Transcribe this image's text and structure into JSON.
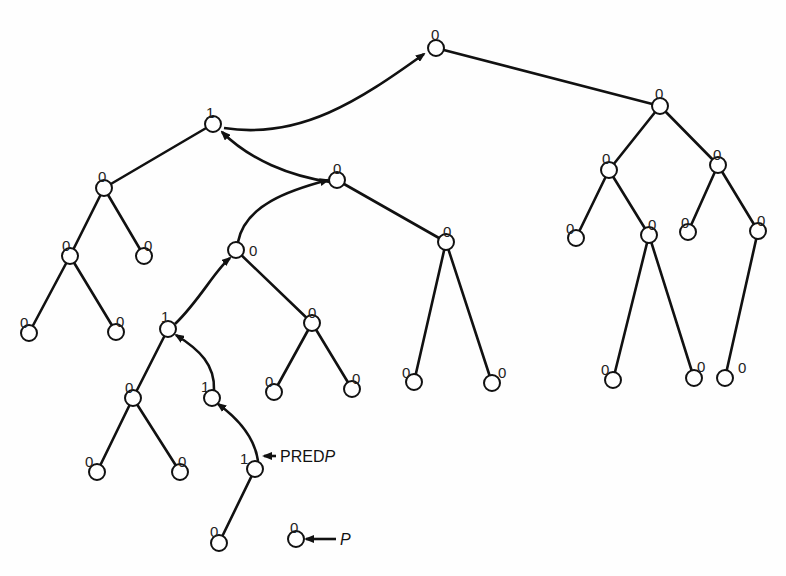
{
  "diagram": {
    "type": "threaded binary tree",
    "nodes": [
      {
        "id": "root",
        "x": 436,
        "y": 48,
        "tag": "0",
        "lx": 431,
        "ly": 28
      },
      {
        "id": "R",
        "x": 660,
        "y": 106,
        "tag": "0",
        "lx": 655,
        "ly": 87
      },
      {
        "id": "RL",
        "x": 609,
        "y": 170,
        "tag": "0",
        "lx": 602,
        "ly": 152
      },
      {
        "id": "RR",
        "x": 718,
        "y": 165,
        "tag": "0",
        "lx": 713,
        "ly": 148
      },
      {
        "id": "RLL",
        "x": 576,
        "y": 238,
        "tag": "0",
        "lx": 566,
        "ly": 222
      },
      {
        "id": "RLR",
        "x": 649,
        "y": 235,
        "tag": "0",
        "lx": 648,
        "ly": 218
      },
      {
        "id": "RLRL",
        "x": 613,
        "y": 380,
        "tag": "0",
        "lx": 601,
        "ly": 363
      },
      {
        "id": "RLRR",
        "x": 694,
        "y": 378,
        "tag": "0",
        "lx": 697,
        "ly": 360
      },
      {
        "id": "RRL",
        "x": 688,
        "y": 232,
        "tag": "0",
        "lx": 681,
        "ly": 216
      },
      {
        "id": "RRR",
        "x": 758,
        "y": 231,
        "tag": "0",
        "lx": 757,
        "ly": 214
      },
      {
        "id": "RRRL",
        "x": 725,
        "y": 378,
        "tag": "0",
        "lx": 738,
        "ly": 361
      },
      {
        "id": "A",
        "x": 213,
        "y": 124,
        "tag": "1",
        "lx": 206,
        "ly": 106
      },
      {
        "id": "AL",
        "x": 104,
        "y": 188,
        "tag": "0",
        "lx": 98,
        "ly": 170
      },
      {
        "id": "AR",
        "x": 337,
        "y": 180,
        "tag": "0",
        "lx": 333,
        "ly": 162
      },
      {
        "id": "ALL",
        "x": 70,
        "y": 256,
        "tag": "0",
        "lx": 62,
        "ly": 239
      },
      {
        "id": "ALR",
        "x": 144,
        "y": 256,
        "tag": "0",
        "lx": 144,
        "ly": 239
      },
      {
        "id": "ALLL",
        "x": 29,
        "y": 333,
        "tag": "0",
        "lx": 20,
        "ly": 316
      },
      {
        "id": "ALLR",
        "x": 116,
        "y": 332,
        "tag": "0",
        "lx": 116,
        "ly": 315
      },
      {
        "id": "ARL",
        "x": 236,
        "y": 250,
        "tag": "0",
        "lx": 249,
        "ly": 244
      },
      {
        "id": "ARR",
        "x": 446,
        "y": 242,
        "tag": "0",
        "lx": 443,
        "ly": 225
      },
      {
        "id": "ARRL",
        "x": 414,
        "y": 382,
        "tag": "0",
        "lx": 402,
        "ly": 366
      },
      {
        "id": "ARRR",
        "x": 492,
        "y": 383,
        "tag": "0",
        "lx": 498,
        "ly": 366
      },
      {
        "id": "ARLL",
        "x": 168,
        "y": 329,
        "tag": "1",
        "lx": 161,
        "ly": 310
      },
      {
        "id": "ARLR",
        "x": 312,
        "y": 323,
        "tag": "0",
        "lx": 308,
        "ly": 306
      },
      {
        "id": "ARLRL",
        "x": 274,
        "y": 392,
        "tag": "0",
        "lx": 265,
        "ly": 375
      },
      {
        "id": "ARLRR",
        "x": 352,
        "y": 389,
        "tag": "0",
        "lx": 352,
        "ly": 372
      },
      {
        "id": "ARLLL",
        "x": 133,
        "y": 398,
        "tag": "0",
        "lx": 125,
        "ly": 381
      },
      {
        "id": "ARLLR",
        "x": 212,
        "y": 398,
        "tag": "1",
        "lx": 201,
        "ly": 380
      },
      {
        "id": "ARLLLL",
        "x": 97,
        "y": 472,
        "tag": "0",
        "lx": 85,
        "ly": 455
      },
      {
        "id": "ARLLLR",
        "x": 180,
        "y": 472,
        "tag": "0",
        "lx": 178,
        "ly": 455
      },
      {
        "id": "ARLLRR",
        "x": 255,
        "y": 469,
        "tag": "1",
        "lx": 240,
        "ly": 452
      },
      {
        "id": "ARLLRRL",
        "x": 219,
        "y": 543,
        "tag": "0",
        "lx": 210,
        "ly": 525
      },
      {
        "id": "P",
        "x": 296,
        "y": 539,
        "tag": "0",
        "lx": 290,
        "ly": 521
      }
    ],
    "edges": [
      [
        "root",
        "R"
      ],
      [
        "R",
        "RL"
      ],
      [
        "R",
        "RR"
      ],
      [
        "RL",
        "RLL"
      ],
      [
        "RL",
        "RLR"
      ],
      [
        "RLR",
        "RLRL"
      ],
      [
        "RLR",
        "RLRR"
      ],
      [
        "RR",
        "RRL"
      ],
      [
        "RR",
        "RRR"
      ],
      [
        "RRR",
        "RRRL"
      ],
      [
        "A",
        "AL"
      ],
      [
        "AL",
        "ALL"
      ],
      [
        "AL",
        "ALR"
      ],
      [
        "ALL",
        "ALLL"
      ],
      [
        "ALL",
        "ALLR"
      ],
      [
        "AR",
        "ARR"
      ],
      [
        "ARR",
        "ARRL"
      ],
      [
        "ARR",
        "ARRR"
      ],
      [
        "ARL",
        "ARLR"
      ],
      [
        "ARLR",
        "ARLRL"
      ],
      [
        "ARLR",
        "ARLRR"
      ],
      [
        "ARLL",
        "ARLLL"
      ],
      [
        "ARLLL",
        "ARLLLL"
      ],
      [
        "ARLLL",
        "ARLLLR"
      ],
      [
        "ARLLRR",
        "ARLLRRL"
      ]
    ],
    "threads": [
      {
        "from": "A",
        "to": "root",
        "path": "M224,128 C300,140 360,100 424,54"
      },
      {
        "from": "AR",
        "to": "A",
        "path": "M330,182 C290,176 250,160 222,132"
      },
      {
        "from": "ARL",
        "to": "AR",
        "path": "M238,242 C245,205 290,190 328,180"
      },
      {
        "from": "ARLL",
        "to": "ARL",
        "path": "M175,324 C200,300 215,270 230,258"
      },
      {
        "from": "ARLLR",
        "to": "ARLL",
        "path": "M214,390 C215,365 200,350 176,335"
      },
      {
        "from": "ARLLRR",
        "to": "ARLLR",
        "path": "M258,461 C255,440 240,420 218,404"
      }
    ],
    "pointers": [
      {
        "label": "PRED",
        "label_italic": "P",
        "text_x": 280,
        "text_y": 462,
        "line": [
          276,
          456,
          264,
          456
        ]
      },
      {
        "label": "",
        "label_italic": "P",
        "text_x": 338,
        "text_y": 544,
        "line": [
          336,
          539,
          306,
          539
        ]
      }
    ]
  },
  "labels": {
    "pred_pointer_text": "PRED",
    "pred_pointer_italic": "P",
    "p_pointer_italic": "P"
  }
}
